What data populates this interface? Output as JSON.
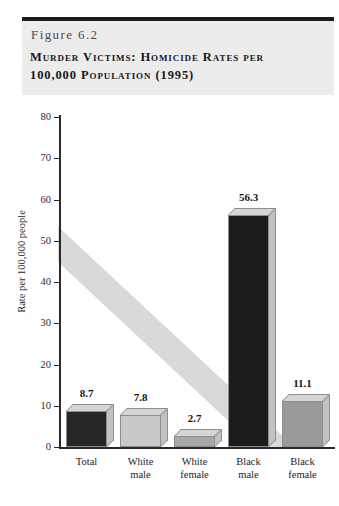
{
  "header": {
    "figure_number": "Figure 6.2",
    "title_line1": "Murder Victims: Homicide Rates per",
    "title_line2": "100,000 Population (1995)",
    "background_color": "#ececed",
    "rule_color": "#1b1b1b"
  },
  "chart_data": {
    "type": "bar",
    "title": "Murder Victims: Homicide Rates per 100,000 Population (1995)",
    "xlabel": "",
    "ylabel": "Rate per 100,000 people",
    "categories": [
      "Total",
      "White male",
      "White female",
      "Black male",
      "Black female"
    ],
    "category_lines": [
      [
        "Total"
      ],
      [
        "White",
        "male"
      ],
      [
        "White",
        "female"
      ],
      [
        "Black",
        "male"
      ],
      [
        "Black",
        "female"
      ]
    ],
    "values": [
      8.7,
      7.8,
      2.7,
      56.3,
      11.1
    ],
    "value_labels": [
      "8.7",
      "7.8",
      "2.7",
      "56.3",
      "11.1"
    ],
    "bar_colors": [
      "#262626",
      "#c9c9c9",
      "#a8a8a8",
      "#1c1c1c",
      "#9a9a9a"
    ],
    "ylim": [
      0,
      80
    ],
    "yticks": [
      0,
      10,
      20,
      30,
      40,
      50,
      60,
      70,
      80
    ],
    "ytick_labels": [
      "0",
      "10",
      "20",
      "30",
      "40",
      "50",
      "60",
      "70",
      "80"
    ],
    "grid": false,
    "legend": false,
    "style": "3d-bars"
  }
}
